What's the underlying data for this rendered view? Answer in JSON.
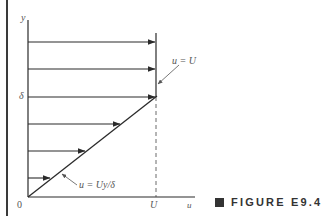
{
  "figure": {
    "caption_marker": "■",
    "caption": "FIGURE E9.4",
    "axes": {
      "y_label": "y",
      "x_label": "u",
      "origin_label": "0",
      "y_tick_label": "δ",
      "x_tick_label": "U"
    },
    "annotations": {
      "upper": "u = U",
      "lower": "u = Uy/δ"
    },
    "profile": {
      "type": "linear velocity profile",
      "arrow_count": 6,
      "arrows_above_delta": 3,
      "arrows_below_delta": 3
    },
    "colors": {
      "line": "#2a2a2a",
      "label": "#555555",
      "background": "#ffffff"
    }
  }
}
